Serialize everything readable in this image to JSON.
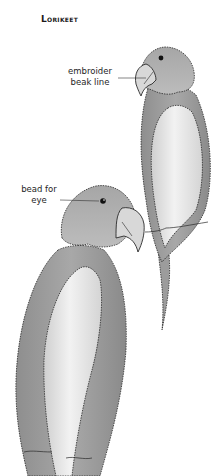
{
  "title": "Lorikeet",
  "callouts": [
    {
      "id": "beak",
      "text": "embroider beak line"
    },
    {
      "id": "eye",
      "text": "bead for eye"
    }
  ],
  "callout_lines": {
    "beak": [
      "embroider",
      "beak line"
    ],
    "eye": [
      "bead for",
      "eye"
    ]
  },
  "figures": [
    {
      "name": "upper-lorikeet",
      "facing": "left",
      "parts": [
        "head",
        "beak",
        "eye",
        "wing",
        "chest",
        "tail"
      ]
    },
    {
      "name": "lower-lorikeet",
      "facing": "right",
      "parts": [
        "head",
        "beak",
        "eye",
        "wing",
        "chest",
        "tail"
      ]
    }
  ],
  "colors": {
    "outline": "#2a2a2a",
    "body_shade": "#9a9a9a",
    "body_light": "#b8b8b8",
    "wing_light": "#e2e2e2",
    "beak": "#d6d6d6",
    "eye": "#111111",
    "background": "#ffffff"
  }
}
